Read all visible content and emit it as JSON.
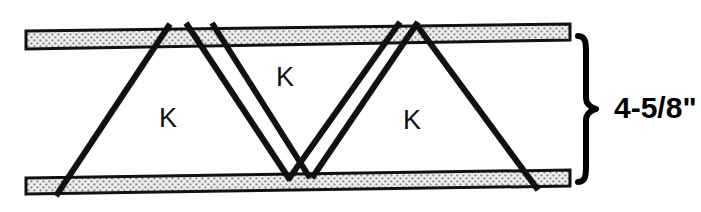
{
  "figure": {
    "background_color": "#ffffff",
    "line_color": "#111111",
    "chord_fill_color": "#e8e8e8",
    "chord_stipple_color": "#6f6f6f",
    "width_px": 701,
    "height_px": 212
  },
  "chords": {
    "top": {
      "name": "top-chord",
      "label": ""
    },
    "bottom": {
      "name": "bottom-chord",
      "label": ""
    }
  },
  "web_labels": [
    {
      "text": "K",
      "x": 168,
      "y": 120
    },
    {
      "text": "K",
      "x": 285,
      "y": 79
    },
    {
      "text": "K",
      "x": 412,
      "y": 122
    }
  ],
  "dimension": {
    "value": "4-5/8\"",
    "text_x": 614,
    "text_y": 110,
    "brace_top_y": 36,
    "brace_bottom_y": 182,
    "brace_x": 578
  }
}
